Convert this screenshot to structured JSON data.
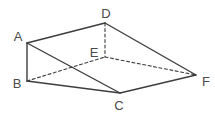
{
  "figure": {
    "background_color": "#ffffff",
    "stroke_color": "#3d3d3d",
    "label_color": "#4a4a4a",
    "label_font_size": 13,
    "solid_stroke_width": 1.4,
    "dashed_stroke_width": 1.1,
    "dash_pattern": "3 2.5",
    "canvas": {
      "width": 215,
      "height": 115
    },
    "vertices": {
      "A": {
        "label": "A",
        "x": 27,
        "y": 43,
        "label_x": 18,
        "label_y": 41
      },
      "B": {
        "label": "B",
        "x": 27,
        "y": 81,
        "label_x": 17,
        "label_y": 88
      },
      "C": {
        "label": "C",
        "x": 120,
        "y": 93,
        "label_x": 119,
        "label_y": 110
      },
      "D": {
        "label": "D",
        "x": 105,
        "y": 23,
        "label_x": 106,
        "label_y": 18
      },
      "E": {
        "label": "E",
        "x": 105,
        "y": 57,
        "label_x": 94,
        "label_y": 57
      },
      "F": {
        "label": "F",
        "x": 196,
        "y": 75,
        "label_x": 206,
        "label_y": 86
      }
    },
    "edges": [
      {
        "from": "A",
        "to": "B",
        "style": "solid"
      },
      {
        "from": "A",
        "to": "D",
        "style": "solid"
      },
      {
        "from": "A",
        "to": "C",
        "style": "solid"
      },
      {
        "from": "B",
        "to": "C",
        "style": "solid"
      },
      {
        "from": "C",
        "to": "F",
        "style": "solid"
      },
      {
        "from": "D",
        "to": "F",
        "style": "solid"
      },
      {
        "from": "D",
        "to": "E",
        "style": "dashed"
      },
      {
        "from": "B",
        "to": "E",
        "style": "dashed"
      },
      {
        "from": "E",
        "to": "F",
        "style": "dashed"
      }
    ]
  }
}
